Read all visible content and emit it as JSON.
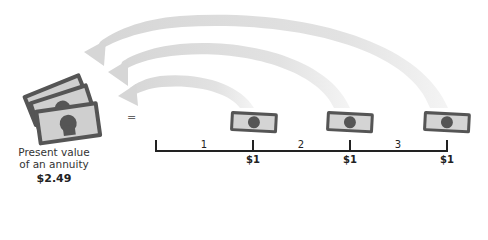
{
  "diagram": {
    "title": "Present value of an annuity",
    "present_value": {
      "label_line1": "Present value",
      "label_line2": "of an annuity",
      "value": "$2.49"
    },
    "equals_sign": "=",
    "timeline": {
      "periods": [
        "1",
        "2",
        "3"
      ],
      "cash_flows": [
        "$1",
        "$1",
        "$1"
      ]
    },
    "colors": {
      "arrow": "#d9d9d9",
      "bill_outline": "#555555",
      "bill_fill": "#cfcfcf",
      "timeline": "#222222"
    }
  }
}
